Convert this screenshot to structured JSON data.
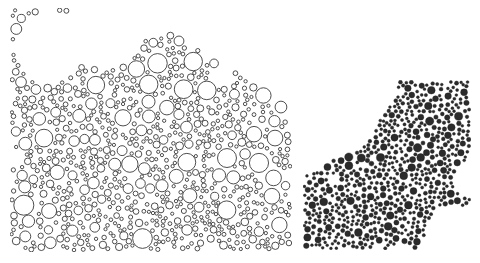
{
  "figure": {
    "background": "#ffffff",
    "panels": [
      {
        "id": "open-packing",
        "description": "Polydisperse circle packing drawn as outlined (unfilled) circles",
        "x": 10,
        "y": 8,
        "width": 282,
        "height": 244,
        "style": "outline",
        "stroke": "#3a3a3a",
        "fill": "#ffffff",
        "stroke_width": 0.9,
        "r_min": 1.6,
        "r_max": 11.5,
        "seed": 7,
        "attempts": 9000,
        "voids": [
          {
            "cx": 40,
            "cy": 38,
            "r": 36
          },
          {
            "cx": 95,
            "cy": 22,
            "r": 40
          },
          {
            "cx": 140,
            "cy": 10,
            "r": 22
          },
          {
            "cx": 235,
            "cy": 8,
            "r": 40
          },
          {
            "cx": 270,
            "cy": 40,
            "r": 36
          },
          {
            "cx": 282,
            "cy": 70,
            "r": 20
          },
          {
            "cx": 210,
            "cy": 68,
            "r": 12
          },
          {
            "cx": 5,
            "cy": 150,
            "r": 10
          }
        ],
        "diagonal_cut": {
          "x1": 120,
          "y1": 0,
          "x2": 282,
          "y2": 100
        }
      },
      {
        "id": "filled-packing",
        "description": "Dense aggregate of small dark filled disks with fractal-like boundary",
        "x": 303,
        "y": 80,
        "width": 168,
        "height": 170,
        "style": "filled",
        "stroke": "#1e1e1e",
        "fill": "#2b2b2b",
        "stroke_width": 0.4,
        "r_min": 1.4,
        "r_max": 4.2,
        "seed": 23,
        "attempts": 9000,
        "voids": [
          {
            "cx": 20,
            "cy": 20,
            "r": 60
          },
          {
            "cx": 0,
            "cy": 60,
            "r": 35
          },
          {
            "cx": 50,
            "cy": 0,
            "r": 45
          },
          {
            "cx": 168,
            "cy": 100,
            "r": 18
          },
          {
            "cx": 150,
            "cy": 150,
            "r": 26
          },
          {
            "cx": 168,
            "cy": 170,
            "r": 30
          },
          {
            "cx": 130,
            "cy": 168,
            "r": 14
          },
          {
            "cx": 100,
            "cy": 172,
            "r": 10
          },
          {
            "cx": 75,
            "cy": 168,
            "r": 6
          },
          {
            "cx": 30,
            "cy": 100,
            "r": 6
          }
        ],
        "diagonal_cut": {
          "x1": 0,
          "y1": 45,
          "x2": 95,
          "y2": 0
        }
      }
    ]
  }
}
